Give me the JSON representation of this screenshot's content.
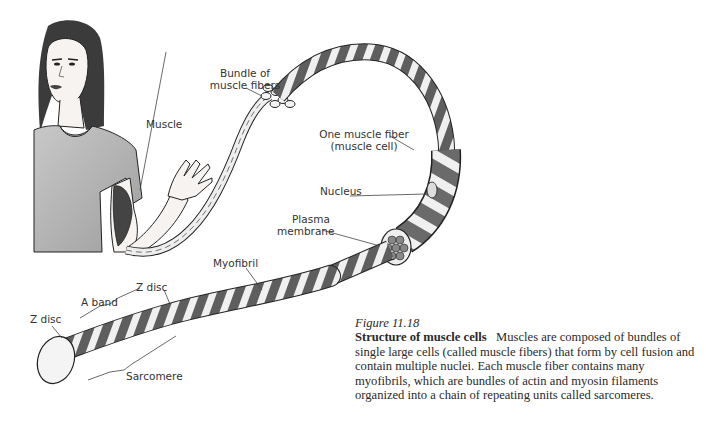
{
  "figure": {
    "number": "Figure 11.18",
    "title": "Structure of muscle cells",
    "body": "Muscles are composed of bundles of single large cells (called muscle fibers) that form by cell fusion and contain multiple nuclei. Each muscle fiber contains many myofibrils, which are bundles of actin and myosin filaments organized into a chain of repeating units called sarcomeres."
  },
  "labels": {
    "muscle": "Muscle",
    "bundle_line1": "Bundle of",
    "bundle_line2": "muscle fibers",
    "fiber_line1": "One muscle fiber",
    "fiber_line2": "(muscle cell)",
    "nucleus": "Nucleus",
    "plasma_line1": "Plasma",
    "plasma_line2": "membrane",
    "myofibril": "Myofibril",
    "z_disc_left": "Z disc",
    "a_band": "A band",
    "z_disc_mid": "Z disc",
    "sarcomere": "Sarcomere"
  },
  "colors": {
    "band_dark": "#6f6f6f",
    "band_light": "#f2f2f2",
    "shirt": "#b9b9b9",
    "hair": "#3a3a3a",
    "outline": "#1e1e1e"
  }
}
